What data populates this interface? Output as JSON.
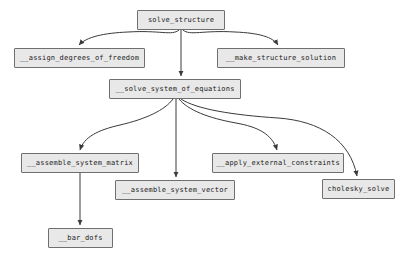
{
  "diagram": {
    "type": "call-graph",
    "background_color": "#ffffff",
    "node_fill_color": "#e8e8e8",
    "node_border_color": "#6f6f6f",
    "edge_color": "#3a3a3a",
    "nodes": [
      {
        "id": "solve_structure",
        "label": "solve_structure",
        "x": 137,
        "y": 10,
        "w": 88,
        "h": 20
      },
      {
        "id": "assign_dof",
        "label": "__assign_degrees_of_freedom",
        "x": 14,
        "y": 48,
        "w": 131,
        "h": 20
      },
      {
        "id": "make_solution",
        "label": "__make_structure_solution",
        "x": 217,
        "y": 48,
        "w": 128,
        "h": 20
      },
      {
        "id": "solve_system",
        "label": "__solve_system_of_equations",
        "x": 109,
        "y": 79,
        "w": 132,
        "h": 20
      },
      {
        "id": "assemble_matrix",
        "label": "__assemble_system_matrix",
        "x": 21,
        "y": 153,
        "w": 118,
        "h": 20
      },
      {
        "id": "apply_constraints",
        "label": "__apply_external_constraints",
        "x": 212,
        "y": 153,
        "w": 132,
        "h": 20
      },
      {
        "id": "assemble_vector",
        "label": "__assemble_system_vector",
        "x": 115,
        "y": 180,
        "w": 120,
        "h": 20
      },
      {
        "id": "cholesky_solve",
        "label": "cholesky_solve",
        "x": 322,
        "y": 179,
        "w": 73,
        "h": 20
      },
      {
        "id": "bar_dofs",
        "label": "__bar_dofs",
        "x": 48,
        "y": 228,
        "w": 65,
        "h": 20
      }
    ],
    "edges": [
      {
        "from": "solve_structure",
        "to": "assign_dof"
      },
      {
        "from": "solve_structure",
        "to": "solve_system"
      },
      {
        "from": "solve_structure",
        "to": "make_solution"
      },
      {
        "from": "solve_system",
        "to": "assemble_matrix"
      },
      {
        "from": "solve_system",
        "to": "assemble_vector"
      },
      {
        "from": "solve_system",
        "to": "apply_constraints"
      },
      {
        "from": "solve_system",
        "to": "cholesky_solve"
      },
      {
        "from": "assemble_matrix",
        "to": "bar_dofs"
      }
    ]
  }
}
